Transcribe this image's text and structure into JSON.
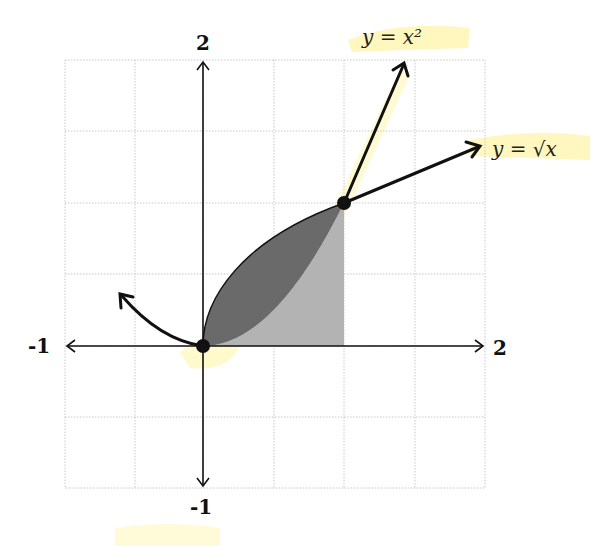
{
  "figure": {
    "axes": {
      "x_min_label": "-1",
      "x_max_label": "2",
      "y_min_label": "-1",
      "y_max_label": "2"
    },
    "curves": {
      "parabola_label": "y = x²",
      "sqrt_label": "y = √x"
    },
    "points": [
      {
        "x": 0,
        "y": 0
      },
      {
        "x": 1,
        "y": 1
      }
    ],
    "grid_step": 0.5,
    "colors": {
      "region_between": "#6a6a6a",
      "region_under_parabola": "#b3b3b3",
      "highlight": "#fff5a0",
      "curve": "#111111"
    }
  }
}
